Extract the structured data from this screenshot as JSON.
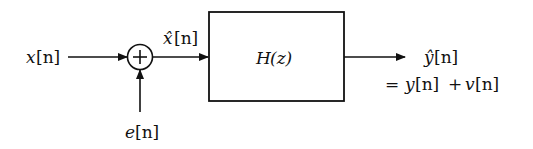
{
  "diagram": {
    "type": "block-diagram",
    "input": {
      "symbol": "x",
      "index": "[n]",
      "label": "x[n]"
    },
    "noise_input": {
      "symbol": "e",
      "index": "[n]",
      "label": "e[n]"
    },
    "summing_junction": {
      "operator": "+"
    },
    "intermediate": {
      "symbol": "x̂",
      "index": "[n]",
      "label": "x̂[n]"
    },
    "system_block": {
      "label": "H(z)",
      "name": "H",
      "arg": "(z)"
    },
    "output": {
      "symbol": "ŷ",
      "index": "[n]",
      "label": "ŷ[n]"
    },
    "output_equation": {
      "equals": "=",
      "y": "y",
      "y_index": "[n]",
      "plus": "+",
      "v": "v",
      "v_index": "[n]",
      "text": "= y[n] + v[n]"
    }
  },
  "colors": {
    "stroke": "#111111",
    "background": "#ffffff"
  }
}
